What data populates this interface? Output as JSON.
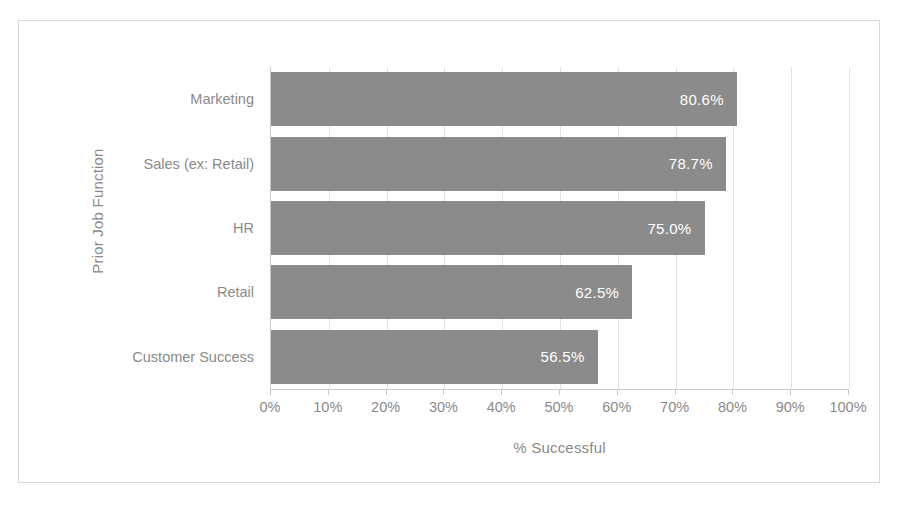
{
  "chart_data": {
    "type": "bar",
    "orientation": "horizontal",
    "title": "",
    "xlabel": "% Successful",
    "ylabel": "Prior Job Function",
    "categories": [
      "Marketing",
      "Sales (ex: Retail)",
      "HR",
      "Retail",
      "Customer Success"
    ],
    "values": [
      80.6,
      78.7,
      75.0,
      62.5,
      56.5
    ],
    "data_labels": [
      "80.6%",
      "78.7%",
      "75.0%",
      "62.5%",
      "56.5%"
    ],
    "xlim": [
      0,
      100
    ],
    "xtick_values": [
      0,
      10,
      20,
      30,
      40,
      50,
      60,
      70,
      80,
      90,
      100
    ],
    "xtick_labels": [
      "0%",
      "10%",
      "20%",
      "30%",
      "40%",
      "50%",
      "60%",
      "70%",
      "80%",
      "90%",
      "100%"
    ],
    "grid": true,
    "grid_axis": "x",
    "legend": false,
    "series": [
      {
        "name": "% Successful",
        "values": [
          80.6,
          78.7,
          75.0,
          62.5,
          56.5
        ]
      }
    ],
    "colors": {
      "bar_fill": "#8b8b8b",
      "data_label_text": "#ffffff",
      "axis_text": "#8a8a8a",
      "gridline": "#e2e2e2",
      "axis_line": "#c9c9c9",
      "frame_border": "#d8d8d8",
      "plot_background": "#ffffff"
    }
  }
}
